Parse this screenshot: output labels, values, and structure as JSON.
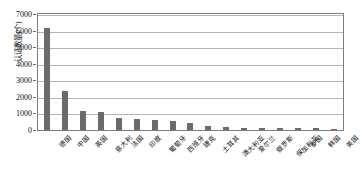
{
  "chart_data": {
    "type": "bar",
    "title": "",
    "xlabel": "",
    "ylabel": "认证数量(个)",
    "ylim": [
      0,
      7000
    ],
    "ytick_labels": [
      "0",
      "1000",
      "2000",
      "3000",
      "4000",
      "5000",
      "6000",
      "7000"
    ],
    "ytick_values": [
      0,
      1000,
      2000,
      3000,
      4000,
      5000,
      6000,
      7000
    ],
    "grid": true,
    "legend": "none",
    "bar_color": "#6b6b6b",
    "categories": [
      "德国",
      "中国",
      "英国",
      "意大利",
      "法国",
      "印度",
      "葡萄牙",
      "西班牙",
      "捷克",
      "土耳其",
      "澳大利亚",
      "爱尔兰",
      "俄罗斯",
      "保加利亚",
      "泰国",
      "韩国",
      "美国"
    ],
    "values": [
      6200,
      2400,
      1180,
      1100,
      760,
      660,
      620,
      560,
      450,
      230,
      170,
      150,
      130,
      120,
      110,
      100,
      90
    ]
  }
}
